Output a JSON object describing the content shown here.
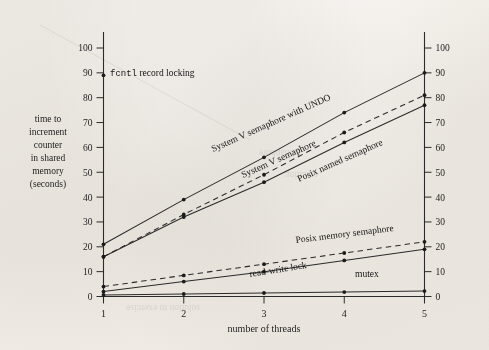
{
  "chart_data": {
    "type": "line",
    "title": "",
    "xlabel": "number of threads",
    "ylabel": "time to increment counter in shared memory (seconds)",
    "ylabel_lines": [
      "time to",
      "increment",
      "counter",
      "in shared",
      "memory",
      "(seconds)"
    ],
    "x": [
      1,
      2,
      3,
      4,
      5
    ],
    "xlim": [
      1,
      5
    ],
    "ylim": [
      0,
      105
    ],
    "xticks": [
      "1",
      "2",
      "3",
      "4",
      "5"
    ],
    "yticks": [
      "0",
      "10",
      "20",
      "30",
      "40",
      "50",
      "60",
      "70",
      "80",
      "90",
      "100"
    ],
    "ytick_values": [
      0,
      10,
      20,
      30,
      40,
      50,
      60,
      70,
      80,
      90,
      100
    ],
    "right_axis": true,
    "right_yticks": [
      "0",
      "10",
      "20",
      "30",
      "40",
      "50",
      "60",
      "70",
      "80",
      "90",
      "100"
    ],
    "grid": false,
    "legend_position": "inline-annotations",
    "series": [
      {
        "name": "fcntl record locking",
        "label_prefix_mono": "fcntl",
        "label_suffix": " record locking",
        "style": "point-only",
        "values": [
          89,
          null,
          null,
          null,
          null
        ],
        "label_x": 1,
        "label_y": 89
      },
      {
        "name": "System V semaphore with UNDO",
        "style": "solid",
        "values": [
          21,
          39,
          56,
          74,
          90
        ],
        "label_angle": -24
      },
      {
        "name": "Posix named semaphore",
        "style": "dashed",
        "values": [
          16,
          33,
          49,
          66,
          81
        ],
        "label_angle": -24
      },
      {
        "name": "System V semaphore",
        "style": "solid",
        "values": [
          16,
          32,
          46,
          62,
          77
        ],
        "label_angle": -24
      },
      {
        "name": "Posix memory semaphore",
        "style": "dashed",
        "values": [
          4,
          8.5,
          13,
          17.5,
          22
        ],
        "label_angle": -6
      },
      {
        "name": "read-write lock",
        "style": "solid",
        "values": [
          2,
          6,
          10,
          14.5,
          19
        ],
        "label_angle": -8
      },
      {
        "name": "mutex",
        "style": "solid",
        "values": [
          0.6,
          1,
          1.4,
          1.8,
          2.2
        ],
        "label_angle": 0
      }
    ],
    "annotations": [
      {
        "name": "fcntl-record-locking",
        "text": "fcntl record locking"
      },
      {
        "name": "sysv-undo",
        "text": "System V semaphore with UNDO"
      },
      {
        "name": "sysv",
        "text": "System V semaphore"
      },
      {
        "name": "posix-named",
        "text": "Posix named semaphore"
      },
      {
        "name": "posix-memory",
        "text": "Posix memory semaphore"
      },
      {
        "name": "rwlock",
        "text": "read-write lock"
      },
      {
        "name": "mutex",
        "text": "mutex"
      }
    ],
    "colors": {
      "ink": "#2a2a2a",
      "paper": "#f1ede7",
      "marker": "#1b1b1b"
    }
  }
}
